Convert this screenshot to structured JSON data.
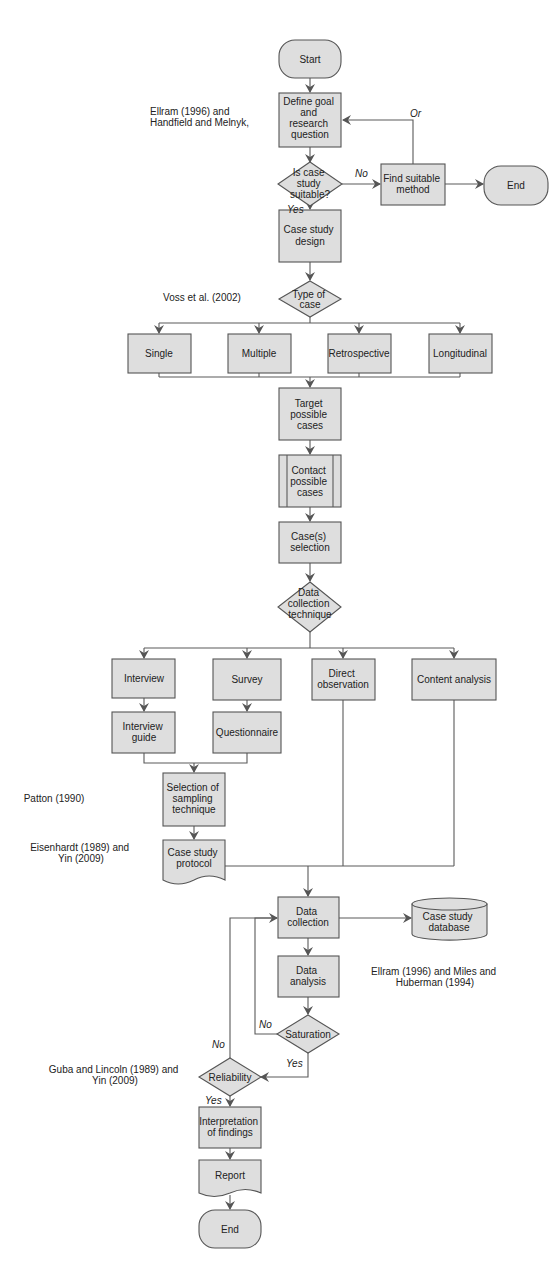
{
  "diagram": {
    "type": "flowchart",
    "nodes": {
      "start": {
        "label": [
          "Start"
        ]
      },
      "define_goal": {
        "label": [
          "Define goal",
          "and",
          "research",
          "question"
        ]
      },
      "is_case_suitable": {
        "label": [
          "Is case",
          "study",
          "suitable?"
        ]
      },
      "find_method": {
        "label": [
          "Find suitable",
          "method"
        ]
      },
      "end_top": {
        "label": [
          "End"
        ]
      },
      "case_design": {
        "label": [
          "Case study",
          "design"
        ]
      },
      "type_of_case": {
        "label": [
          "Type of",
          "case"
        ]
      },
      "single": {
        "label": [
          "Single"
        ]
      },
      "multiple": {
        "label": [
          "Multiple"
        ]
      },
      "retrospective": {
        "label": [
          "Retrospective"
        ]
      },
      "longitudinal": {
        "label": [
          "Longitudinal"
        ]
      },
      "target_cases": {
        "label": [
          "Target",
          "possible",
          "cases"
        ]
      },
      "contact_cases": {
        "label": [
          "Contact",
          "possible",
          "cases"
        ]
      },
      "case_selection": {
        "label": [
          "Case(s)",
          "selection"
        ]
      },
      "data_technique": {
        "label": [
          "Data",
          "collection",
          "technique"
        ]
      },
      "interview": {
        "label": [
          "Interview"
        ]
      },
      "survey": {
        "label": [
          "Survey"
        ]
      },
      "direct_observation": {
        "label": [
          "Direct",
          "observation"
        ]
      },
      "content_analysis": {
        "label": [
          "Content analysis"
        ]
      },
      "interview_guide": {
        "label": [
          "Interview",
          "guide"
        ]
      },
      "questionnaire": {
        "label": [
          "Questionnaire"
        ]
      },
      "sampling": {
        "label": [
          "Selection of",
          "sampling",
          "technique"
        ]
      },
      "protocol": {
        "label": [
          "Case study",
          "protocol"
        ]
      },
      "data_collection": {
        "label": [
          "Data",
          "collection"
        ]
      },
      "database": {
        "label": [
          "Case study",
          "database"
        ]
      },
      "data_analysis": {
        "label": [
          "Data",
          "analysis"
        ]
      },
      "saturation": {
        "label": [
          "Saturation"
        ]
      },
      "reliability": {
        "label": [
          "Reliability"
        ]
      },
      "interpretation": {
        "label": [
          "Interpretation",
          "of findings"
        ]
      },
      "report": {
        "label": [
          "Report"
        ]
      },
      "end_bottom": {
        "label": [
          "End"
        ]
      }
    },
    "edge_labels": {
      "no_suitable": "No",
      "yes_suitable": "Yes",
      "or_loop": "Or",
      "no_saturation": "No",
      "yes_saturation": "Yes",
      "no_reliability": "No",
      "yes_reliability": "Yes"
    },
    "references": {
      "ref_goal": [
        "Ellram (1996) and",
        "Handfield and Melnyk,"
      ],
      "ref_type": [
        "Voss et al. (2002)"
      ],
      "ref_sampling": [
        "Patton (1990)"
      ],
      "ref_protocol": [
        "Eisenhardt (1989) and",
        "Yin (2009)"
      ],
      "ref_analysis": [
        "Ellram (1996) and Miles and",
        "Huberman (1994)"
      ],
      "ref_reliability": [
        "Guba and Lincoln (1989) and",
        "Yin (2009)"
      ]
    },
    "colors": {
      "node_fill": "#dedede",
      "stroke": "#555555",
      "background": "#ffffff"
    }
  }
}
